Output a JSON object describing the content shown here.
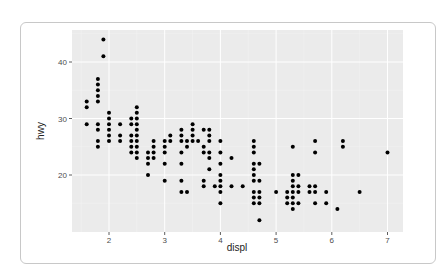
{
  "chart_data": {
    "type": "scatter",
    "title": "",
    "xlabel": "displ",
    "ylabel": "hwy",
    "xlim": [
      1.45,
      7.15
    ],
    "ylim": [
      10.5,
      45.5
    ],
    "x_ticks": [
      2,
      3,
      4,
      5,
      6,
      7
    ],
    "y_ticks": [
      20,
      30,
      40
    ],
    "grid": true,
    "legend": "none",
    "panel_background": "#ebebeb",
    "point_color": "#000000",
    "points": [
      [
        1.6,
        33
      ],
      [
        1.6,
        32
      ],
      [
        1.6,
        29
      ],
      [
        1.8,
        37
      ],
      [
        1.8,
        36
      ],
      [
        1.8,
        35
      ],
      [
        1.8,
        34
      ],
      [
        1.8,
        33
      ],
      [
        1.8,
        29
      ],
      [
        1.8,
        28
      ],
      [
        1.8,
        26
      ],
      [
        1.8,
        25
      ],
      [
        1.9,
        44
      ],
      [
        1.9,
        41
      ],
      [
        2.0,
        31
      ],
      [
        2.0,
        30
      ],
      [
        2.0,
        29
      ],
      [
        2.0,
        28
      ],
      [
        2.0,
        27
      ],
      [
        2.0,
        26
      ],
      [
        2.2,
        29
      ],
      [
        2.2,
        27
      ],
      [
        2.2,
        26
      ],
      [
        2.4,
        30
      ],
      [
        2.4,
        29
      ],
      [
        2.4,
        27
      ],
      [
        2.4,
        26
      ],
      [
        2.4,
        25
      ],
      [
        2.4,
        24
      ],
      [
        2.5,
        32
      ],
      [
        2.5,
        31
      ],
      [
        2.5,
        30
      ],
      [
        2.5,
        29
      ],
      [
        2.5,
        28
      ],
      [
        2.5,
        27
      ],
      [
        2.5,
        26
      ],
      [
        2.5,
        25
      ],
      [
        2.5,
        24
      ],
      [
        2.5,
        23
      ],
      [
        2.7,
        24
      ],
      [
        2.7,
        23
      ],
      [
        2.7,
        22
      ],
      [
        2.7,
        20
      ],
      [
        2.8,
        26
      ],
      [
        2.8,
        25
      ],
      [
        2.8,
        24
      ],
      [
        2.8,
        23
      ],
      [
        3.0,
        26
      ],
      [
        3.0,
        25
      ],
      [
        3.0,
        24
      ],
      [
        3.0,
        22
      ],
      [
        3.0,
        19
      ],
      [
        3.1,
        27
      ],
      [
        3.1,
        26
      ],
      [
        3.3,
        28
      ],
      [
        3.3,
        27
      ],
      [
        3.3,
        26
      ],
      [
        3.3,
        24
      ],
      [
        3.3,
        22
      ],
      [
        3.3,
        19
      ],
      [
        3.3,
        17
      ],
      [
        3.4,
        26
      ],
      [
        3.4,
        25
      ],
      [
        3.4,
        17
      ],
      [
        3.5,
        29
      ],
      [
        3.5,
        28
      ],
      [
        3.5,
        27
      ],
      [
        3.5,
        26
      ],
      [
        3.6,
        26
      ],
      [
        3.7,
        28
      ],
      [
        3.7,
        25
      ],
      [
        3.7,
        24
      ],
      [
        3.7,
        19
      ],
      [
        3.7,
        18
      ],
      [
        3.8,
        28
      ],
      [
        3.8,
        27
      ],
      [
        3.8,
        26
      ],
      [
        3.8,
        24
      ],
      [
        3.8,
        23
      ],
      [
        3.8,
        21
      ],
      [
        3.9,
        18
      ],
      [
        4.0,
        26
      ],
      [
        4.0,
        24
      ],
      [
        4.0,
        22
      ],
      [
        4.0,
        20
      ],
      [
        4.0,
        19
      ],
      [
        4.0,
        18
      ],
      [
        4.0,
        17
      ],
      [
        4.0,
        15
      ],
      [
        4.2,
        23
      ],
      [
        4.2,
        18
      ],
      [
        4.4,
        18
      ],
      [
        4.6,
        26
      ],
      [
        4.6,
        25
      ],
      [
        4.6,
        24
      ],
      [
        4.6,
        22
      ],
      [
        4.6,
        21
      ],
      [
        4.6,
        20
      ],
      [
        4.6,
        19
      ],
      [
        4.6,
        17
      ],
      [
        4.6,
        16
      ],
      [
        4.6,
        15
      ],
      [
        4.7,
        22
      ],
      [
        4.7,
        19
      ],
      [
        4.7,
        17
      ],
      [
        4.7,
        16
      ],
      [
        4.7,
        15
      ],
      [
        4.7,
        12
      ],
      [
        5.0,
        17
      ],
      [
        5.2,
        17
      ],
      [
        5.2,
        16
      ],
      [
        5.2,
        15
      ],
      [
        5.3,
        25
      ],
      [
        5.3,
        20
      ],
      [
        5.3,
        19
      ],
      [
        5.3,
        18
      ],
      [
        5.3,
        17
      ],
      [
        5.3,
        16
      ],
      [
        5.3,
        15
      ],
      [
        5.3,
        14
      ],
      [
        5.4,
        20
      ],
      [
        5.4,
        18
      ],
      [
        5.4,
        17
      ],
      [
        5.4,
        15
      ],
      [
        5.6,
        18
      ],
      [
        5.6,
        17
      ],
      [
        5.7,
        26
      ],
      [
        5.7,
        24
      ],
      [
        5.7,
        18
      ],
      [
        5.7,
        17
      ],
      [
        5.7,
        15
      ],
      [
        5.9,
        17
      ],
      [
        5.9,
        15
      ],
      [
        6.1,
        14
      ],
      [
        6.2,
        26
      ],
      [
        6.2,
        25
      ],
      [
        6.5,
        17
      ],
      [
        7.0,
        24
      ]
    ]
  }
}
